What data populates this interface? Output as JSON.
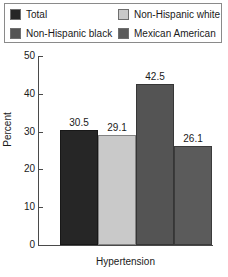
{
  "chart_data": {
    "type": "bar",
    "title": "",
    "subtitle": "",
    "xlabel": "Hypertension",
    "ylabel": "Percent",
    "categories": [
      "Hypertension"
    ],
    "ylim": [
      0,
      50
    ],
    "yticks": [
      0,
      10,
      20,
      30,
      40,
      50
    ],
    "ytick_labels": [
      "0",
      "10",
      "20",
      "30",
      "40",
      "50"
    ],
    "grid": false,
    "legend_position": "top",
    "series": [
      {
        "name": "Total",
        "values": [
          30.5
        ],
        "label": "30.5",
        "color": "#262626"
      },
      {
        "name": "Non-Hispanic white",
        "values": [
          29.1
        ],
        "label": "29.1",
        "color": "#c9c9c9"
      },
      {
        "name": "Non-Hispanic black",
        "values": [
          42.5
        ],
        "label": "42.5",
        "color": "#545454"
      },
      {
        "name": "Mexican American",
        "values": [
          26.1
        ],
        "label": "26.1",
        "color": "#5b5b5b"
      }
    ]
  },
  "legend": {
    "entries": [
      {
        "label": "Total",
        "color": "#262626"
      },
      {
        "label": "Non-Hispanic white",
        "color": "#c9c9c9"
      },
      {
        "label": "Non-Hispanic black",
        "color": "#545454"
      },
      {
        "label": "Mexican American",
        "color": "#5b5b5b"
      }
    ]
  },
  "axes": {
    "y_title": "Percent",
    "x_title": "Hypertension",
    "y_labels": {
      "t0": "0",
      "t10": "10",
      "t20": "20",
      "t30": "30",
      "t40": "40",
      "t50": "50"
    }
  },
  "bars": {
    "b0": {
      "label": "30.5",
      "name": "Total"
    },
    "b1": {
      "label": "29.1",
      "name": "Non-Hispanic white"
    },
    "b2": {
      "label": "42.5",
      "name": "Non-Hispanic black"
    },
    "b3": {
      "label": "26.1",
      "name": "Mexican American"
    }
  }
}
